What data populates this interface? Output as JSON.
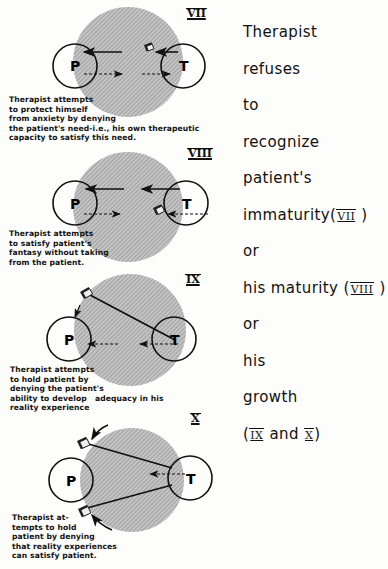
{
  "panels": [
    {
      "numeral": "VII",
      "caption": [
        "Therapist attempts",
        "to protect himself",
        "from anxiety by denying",
        "the patient's need-i.e., his own therapeutic",
        "capacity to satisfy this need."
      ]
    },
    {
      "numeral": "VIII",
      "caption": [
        "Therapist attempts",
        "to satisfy patient's",
        "fantasy without taking",
        "from the patient."
      ]
    },
    {
      "numeral": "IX",
      "caption": [
        "Therapist attempts",
        "to hold patient by",
        "denying the patient's",
        "ability to develop   adequacy in his",
        "reality experience"
      ]
    },
    {
      "numeral": "X",
      "caption": [
        "Therapist at-",
        "tempts to hold",
        "patient by denying",
        "that reality experiences",
        "can satisfy patient."
      ]
    }
  ],
  "labels": {
    "patient": "P",
    "therapist": "T"
  },
  "side_text": {
    "lines": [
      "Therapist",
      "refuses",
      "to",
      "recognize",
      "patient's"
    ],
    "immaturity": "immaturity(",
    "ref7": "VII",
    "close": " )",
    "or1": "or",
    "maturity": "his maturity (",
    "ref8": "VIII",
    "or2": "or",
    "his": "his",
    "growth": "growth",
    "open": "(",
    "ref9": "IX",
    "and": " and ",
    "ref10": "X",
    "end": ")"
  }
}
